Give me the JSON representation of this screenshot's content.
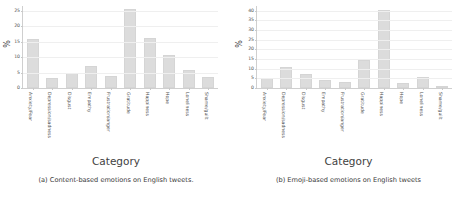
{
  "figure": {
    "panels": [
      {
        "id": "panel-a",
        "caption": "(a) Content-based emotions on English tweets.",
        "chart_data": {
          "type": "bar",
          "title": "",
          "xlabel": "Category",
          "ylabel": "%",
          "ylim": [
            0,
            26.5
          ],
          "yticks": [
            0,
            5,
            10,
            15,
            20,
            25
          ],
          "grid": true,
          "legend": "none",
          "bar_color": "#dcdcdc",
          "categories": [
            "Anxiety/Fear",
            "Depression/sadness",
            "Disgust",
            "Empathy",
            "Frustration/anger",
            "Gratitude",
            "Happiness",
            "Hope",
            "Loneliness",
            "Shame/guilt"
          ],
          "values": [
            16.0,
            3.1,
            4.7,
            7.2,
            3.8,
            25.6,
            16.3,
            10.7,
            5.9,
            3.5
          ]
        }
      },
      {
        "id": "panel-b",
        "caption": "(b) Emoji-based emotions on English tweets",
        "chart_data": {
          "type": "bar",
          "title": "",
          "xlabel": "Category",
          "ylabel": "%",
          "ylim": [
            0,
            42.5
          ],
          "yticks": [
            0,
            5,
            10,
            15,
            20,
            25,
            30,
            35,
            40
          ],
          "grid": true,
          "legend": "none",
          "bar_color": "#dcdcdc",
          "categories": [
            "Anxiety/Fear",
            "Depression/sadness",
            "Disgust",
            "Empathy",
            "Frustration/anger",
            "Gratitude",
            "Happiness",
            "Hope",
            "Loneliness",
            "Shame/guilt"
          ],
          "values": [
            5.3,
            11.0,
            7.5,
            4.2,
            3.0,
            14.6,
            40.5,
            2.5,
            5.7,
            0.7
          ]
        }
      }
    ]
  }
}
